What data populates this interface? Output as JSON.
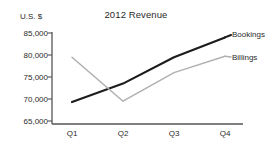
{
  "chart_data": {
    "type": "line",
    "title": "2012 Revenue",
    "xlabel": "",
    "ylabel": "U.S. $",
    "categories": [
      "Q1",
      "Q2",
      "Q3",
      "Q4"
    ],
    "ylim": [
      65000,
      85000
    ],
    "yticks": [
      65000,
      70000,
      75000,
      80000,
      85000
    ],
    "ytick_labels": [
      "65,000",
      "70,000",
      "75,000",
      "80,000",
      "85,000"
    ],
    "grid": false,
    "legend_position": "inline-right",
    "series": [
      {
        "name": "Bookings",
        "color": "#1c1c1c",
        "width": 2.1,
        "values": [
          69300,
          73500,
          79500,
          84000
        ]
      },
      {
        "name": "Billings",
        "color": "#b0b0b0",
        "width": 1.5,
        "values": [
          79500,
          69500,
          76000,
          79700
        ]
      }
    ]
  },
  "axis": {
    "line_color": "#555555",
    "tick_color": "#555555"
  }
}
